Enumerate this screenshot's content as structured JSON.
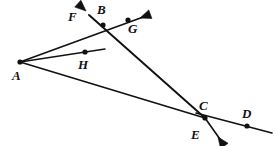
{
  "figure": {
    "canvas": {
      "width": 277,
      "height": 146,
      "background": "#ffffff"
    },
    "stroke_color": "#111111",
    "label_color": "#111111",
    "points": [
      {
        "id": "A",
        "label": "A",
        "x": 20,
        "y": 62,
        "label_x": 12,
        "label_y": 80,
        "dot": true
      },
      {
        "id": "B",
        "label": "B",
        "x": 103,
        "y": 25,
        "label_x": 97,
        "label_y": 14,
        "dot": true
      },
      {
        "id": "C",
        "label": "C",
        "x": 205,
        "y": 118,
        "label_x": 199,
        "label_y": 110,
        "dot": true
      },
      {
        "id": "D",
        "label": "D",
        "x": 247,
        "y": 126,
        "label_x": 242,
        "label_y": 118,
        "dot": true
      },
      {
        "id": "E",
        "label": "E",
        "x": 205,
        "y": 118,
        "label_x": 191,
        "label_y": 139,
        "dot": false
      },
      {
        "id": "F",
        "label": "F",
        "x": 88,
        "y": 14,
        "label_x": 68,
        "label_y": 21,
        "dot": false
      },
      {
        "id": "G",
        "label": "G",
        "x": 128,
        "y": 20,
        "label_x": 128,
        "label_y": 33,
        "dot": true
      },
      {
        "id": "H",
        "label": "H",
        "x": 85,
        "y": 52,
        "label_x": 78,
        "label_y": 69,
        "dot": true
      }
    ],
    "segments": [
      {
        "name": "ray-A-to-B-through-G",
        "from": [
          20,
          62
        ],
        "to": [
          146,
          16
        ],
        "width": 1.6
      },
      {
        "name": "ray-A-through-H",
        "from": [
          20,
          62
        ],
        "to": [
          105,
          49
        ],
        "width": 1.4
      },
      {
        "name": "ray-A-to-E",
        "from": [
          20,
          62
        ],
        "to": [
          205,
          118
        ],
        "width": 1.6
      },
      {
        "name": "line-F-through-B-to-E",
        "from": [
          89,
          15
        ],
        "to": [
          205,
          118
        ],
        "width": 1.9
      },
      {
        "name": "line-E-to-past-D",
        "from": [
          196,
          113
        ],
        "to": [
          272,
          133
        ],
        "width": 1.6
      },
      {
        "name": "ray-C-down-right",
        "from": [
          205,
          118
        ],
        "to": [
          222,
          142
        ],
        "width": 1.6
      }
    ],
    "arrowheads": [
      {
        "name": "arrowhead-F",
        "tip": [
          86,
          11
        ],
        "angle_deg": 222
      },
      {
        "name": "arrowhead-G",
        "tip": [
          140,
          18
        ],
        "angle_deg": 340
      },
      {
        "name": "arrowhead-E-down",
        "tip": [
          218,
          137
        ],
        "angle_deg": 55
      }
    ]
  }
}
